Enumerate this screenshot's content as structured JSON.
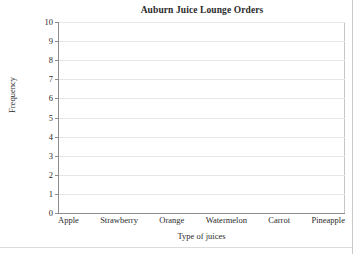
{
  "chart_data": {
    "type": "bar",
    "title": "Auburn Juice Lounge Orders",
    "xlabel": "Type of juices",
    "ylabel": "Frequency",
    "categories": [
      "Apple",
      "Strawberry",
      "Orange",
      "Watermelon",
      "Carrot",
      "Pineapple"
    ],
    "values": [
      0,
      0,
      0,
      0,
      0,
      0
    ],
    "ylim": [
      0,
      10
    ],
    "ytick_labels": [
      "10",
      "9",
      "8",
      "7",
      "6",
      "5",
      "4",
      "3",
      "2",
      "1",
      "0"
    ],
    "ytick_values": [
      10,
      9,
      8,
      7,
      6,
      5,
      4,
      3,
      2,
      1,
      0
    ],
    "grid": "horizontal",
    "legend": "none",
    "note": "Blank chart template: axes and gridlines drawn, no bars plotted"
  },
  "style": {
    "axis_color": "#8c8c8c",
    "grid_color": "#e6e6e6",
    "frame_color": "#c6c6c6",
    "text_color": "#2b2b2b",
    "background": "#ffffff"
  }
}
